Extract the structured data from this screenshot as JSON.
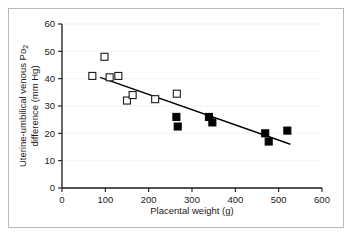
{
  "figure": {
    "border_color": "#b9b9b9",
    "background": "#ffffff"
  },
  "chart_data": {
    "type": "scatter",
    "title": "",
    "xlabel": "Placental weight (g)",
    "ylabel_line1": "Uterine-umbilical venous Po",
    "ylabel_sub": "2",
    "ylabel_line2": "difference (mm Hg)",
    "xlim": [
      0,
      600
    ],
    "ylim": [
      0,
      60
    ],
    "xticks": [
      0,
      100,
      200,
      300,
      400,
      500,
      600
    ],
    "yticks": [
      0,
      10,
      20,
      30,
      40,
      50,
      60
    ],
    "xtick_labels": [
      "0",
      "100",
      "200",
      "300",
      "400",
      "500",
      "600"
    ],
    "ytick_labels": [
      "0",
      "10",
      "20",
      "30",
      "40",
      "50",
      "60"
    ],
    "grid": "horizontal-dotted",
    "grid_color": "#d8d8d8",
    "axis_color": "#1a1a1a",
    "legend": null,
    "marker_size": 7,
    "series": [
      {
        "name": "open-squares",
        "marker": "open-square",
        "fill": "#ffffff",
        "stroke": "#1a1a1a",
        "points": [
          {
            "x": 70,
            "y": 41.0
          },
          {
            "x": 98,
            "y": 48.0
          },
          {
            "x": 110,
            "y": 40.5
          },
          {
            "x": 130,
            "y": 41.0
          },
          {
            "x": 150,
            "y": 32.0
          },
          {
            "x": 163,
            "y": 34.0
          },
          {
            "x": 215,
            "y": 32.5
          },
          {
            "x": 265,
            "y": 34.5
          }
        ]
      },
      {
        "name": "filled-squares",
        "marker": "filled-square",
        "fill": "#000000",
        "stroke": "#000000",
        "points": [
          {
            "x": 264,
            "y": 26.0
          },
          {
            "x": 267,
            "y": 22.5
          },
          {
            "x": 339,
            "y": 26.0
          },
          {
            "x": 347,
            "y": 24.0
          },
          {
            "x": 469,
            "y": 20.0
          },
          {
            "x": 477,
            "y": 17.0
          },
          {
            "x": 520,
            "y": 21.0
          }
        ]
      }
    ],
    "trendline": {
      "name": "regression-line",
      "color": "#000000",
      "x_start": 88,
      "y_start": 40.5,
      "x_end": 527,
      "y_end": 16.0
    }
  }
}
